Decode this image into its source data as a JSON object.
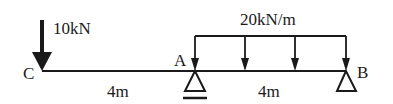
{
  "diagram": {
    "type": "beam-loading",
    "beam": {
      "left_end": "C",
      "right_end": "B"
    },
    "points": [
      {
        "id": "C",
        "label": "C"
      },
      {
        "id": "A",
        "label": "A"
      },
      {
        "id": "B",
        "label": "B"
      }
    ],
    "supports": [
      {
        "at": "A",
        "type": "pin",
        "label": "A"
      },
      {
        "at": "B",
        "type": "roller",
        "label": "B"
      }
    ],
    "loads": {
      "point": {
        "at": "C",
        "label": "10kN",
        "direction": "down"
      },
      "distributed": {
        "from": "A",
        "to": "B",
        "label": "20kN/m",
        "direction": "down"
      }
    },
    "dimensions": [
      {
        "from": "C",
        "to": "A",
        "label": "4m"
      },
      {
        "from": "A",
        "to": "B",
        "label": "4m"
      }
    ],
    "colors": {
      "ink": "#1a1a1a",
      "background": "#ffffff"
    }
  }
}
